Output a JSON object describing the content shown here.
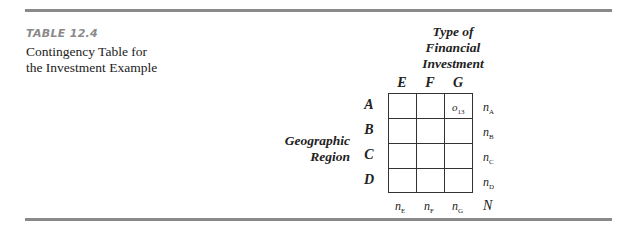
{
  "table": {
    "label": "TABLE 12.4",
    "caption_lines": [
      "Contingency Table for",
      "the Investment Example"
    ],
    "column_title_lines": [
      "Type of",
      "Financial",
      "Investment"
    ],
    "row_title_lines": [
      "Geographic",
      "Region"
    ],
    "columns": [
      "E",
      "F",
      "G"
    ],
    "rows": [
      "A",
      "B",
      "C",
      "D"
    ],
    "cell_entries": [
      {
        "row": "A",
        "col": "G",
        "symbol": "o",
        "subscript": "13"
      }
    ],
    "row_totals": [
      {
        "symbol": "n",
        "subscript": "A"
      },
      {
        "symbol": "n",
        "subscript": "B"
      },
      {
        "symbol": "n",
        "subscript": "C"
      },
      {
        "symbol": "n",
        "subscript": "D"
      }
    ],
    "column_totals": [
      {
        "symbol": "n",
        "subscript": "E"
      },
      {
        "symbol": "n",
        "subscript": "F"
      },
      {
        "symbol": "n",
        "subscript": "G"
      }
    ],
    "grand_total": "N"
  },
  "colors": {
    "rule": "#8a8a8a",
    "label": "#8a8a8a",
    "text": "#222222"
  }
}
